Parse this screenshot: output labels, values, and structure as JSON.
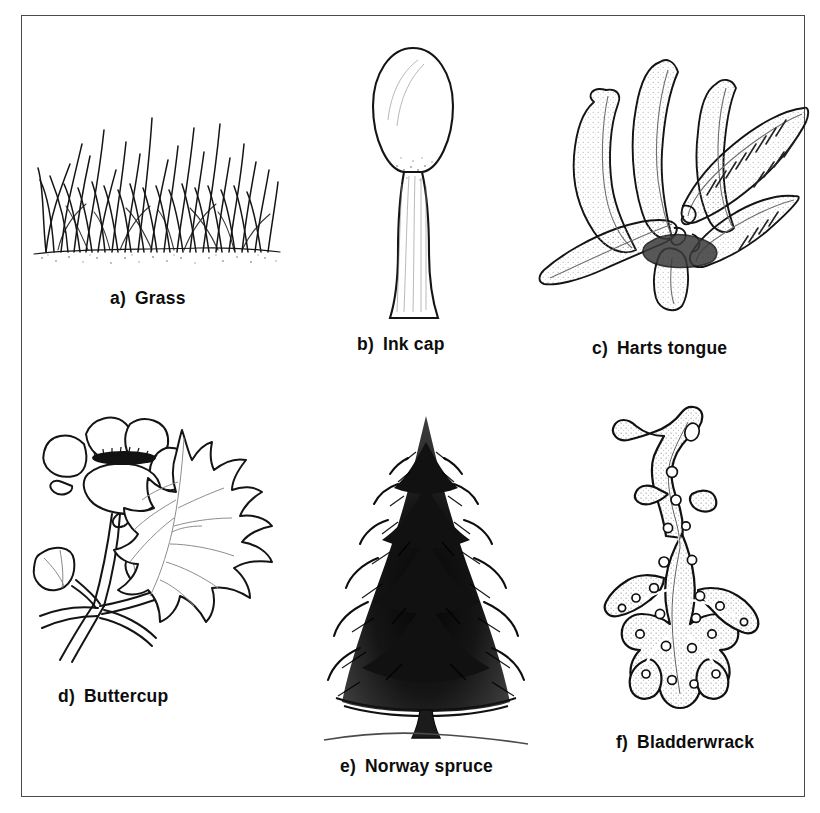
{
  "plate": {
    "title": "Plant groups illustration plate",
    "background_color": "#ffffff",
    "frame_color": "#4a4a4a",
    "ink_color": "#111111",
    "figure_count": 6
  },
  "figures": [
    {
      "key": "grass",
      "index": "a)",
      "label": "Grass",
      "caption": "a)  Grass",
      "icon": "grass-tuft-icon"
    },
    {
      "key": "inkcap",
      "index": "b)",
      "label": "Ink cap",
      "caption": "b)  Ink cap",
      "icon": "ink-cap-mushroom-icon"
    },
    {
      "key": "hartstongue",
      "index": "c)",
      "label": "Harts tongue",
      "caption": "c)  Harts tongue",
      "icon": "harts-tongue-fern-icon"
    },
    {
      "key": "buttercup",
      "index": "d)",
      "label": "Buttercup",
      "caption": "d)  Buttercup",
      "icon": "buttercup-flower-icon"
    },
    {
      "key": "spruce",
      "index": "e)",
      "label": "Norway spruce",
      "caption": "e)  Norway spruce",
      "icon": "norway-spruce-tree-icon"
    },
    {
      "key": "bladderwrack",
      "index": "f)",
      "label": "Bladderwrack",
      "caption": "f)  Bladderwrack",
      "icon": "bladderwrack-seaweed-icon"
    }
  ]
}
